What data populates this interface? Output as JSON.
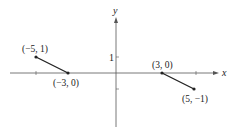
{
  "diagram": {
    "axes": {
      "x_label": "x",
      "y_label": "y",
      "y_tick_label": "1",
      "origin_px": [
        116,
        73
      ],
      "unit_px": 16
    },
    "segments": [
      {
        "start": {
          "label": "(−5, 1)",
          "x": -5,
          "y": 1
        },
        "end": {
          "label": "(−3, 0)",
          "x": -3,
          "y": 0
        }
      },
      {
        "start": {
          "label": "(3, 0)",
          "x": 3,
          "y": 0
        },
        "end": {
          "label": "(5, −1)",
          "x": 5,
          "y": -1
        }
      }
    ],
    "colors": {
      "axis": "#555555",
      "segment": "#222222",
      "text": "#222222"
    }
  }
}
